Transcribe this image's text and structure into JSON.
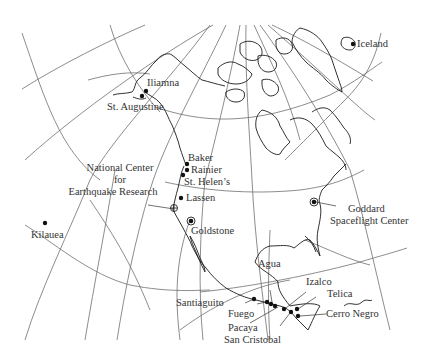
{
  "map": {
    "title": "North America volcano and observation site map",
    "colors": {
      "background": "#ffffff",
      "coastline": "#1a1a1a",
      "graticule": "#6e6e6e",
      "marker": "#111111",
      "label": "#333333"
    },
    "volcanoes": [
      {
        "id": "iliamna",
        "label": "Iliamna",
        "x": 146,
        "y": 91
      },
      {
        "id": "st-augustine",
        "label": "St. Augustine",
        "x": 142,
        "y": 96
      },
      {
        "id": "baker",
        "label": "Baker",
        "x": 187,
        "y": 164
      },
      {
        "id": "rainier",
        "label": "Rainier",
        "x": 187,
        "y": 170
      },
      {
        "id": "st-helens",
        "label": "St. Helen’s",
        "x": 183,
        "y": 175
      },
      {
        "id": "lassen",
        "label": "Lassen",
        "x": 181,
        "y": 198
      },
      {
        "id": "kilauea",
        "label": "Kilauea",
        "x": 45,
        "y": 223
      },
      {
        "id": "agua",
        "label": "Agua",
        "x": 273,
        "y": 303
      },
      {
        "id": "santiaguito",
        "label": "Santiaguito",
        "x": 254,
        "y": 299
      },
      {
        "id": "fuego",
        "label": "Fuego",
        "x": 268,
        "y": 302
      },
      {
        "id": "pacaya",
        "label": "Pacaya",
        "x": 276,
        "y": 306
      },
      {
        "id": "izalco",
        "label": "Izalco",
        "x": 283,
        "y": 308
      },
      {
        "id": "san-cristobal",
        "label": "San Cristobal",
        "x": 290,
        "y": 311
      },
      {
        "id": "telica",
        "label": "Telica",
        "x": 297,
        "y": 310
      },
      {
        "id": "cerro-negro",
        "label": "Cerro Negro",
        "x": 298,
        "y": 316
      },
      {
        "id": "iceland",
        "label": "Iceland",
        "x": 353,
        "y": 44
      }
    ],
    "stations": [
      {
        "id": "ncer",
        "label_line1": "National Center",
        "label_line2": "for",
        "label_line3": "Earthquake Research",
        "x": 174,
        "y": 207
      },
      {
        "id": "goldstone",
        "label": "Goldstone",
        "x": 191,
        "y": 221
      },
      {
        "id": "goddard",
        "label_line1": "Goddard",
        "label_line2": "Spaceflight Center",
        "x": 314,
        "y": 202
      }
    ],
    "labels": {
      "iliamna": "Iliamna",
      "st_augustine": "St. Augustine",
      "baker": "Baker",
      "rainier": "Rainier",
      "st_helens": "St. Helen’s",
      "lassen": "Lassen",
      "kilauea": "Kilauea",
      "iceland": "Iceland",
      "ncer_1": "National Center",
      "ncer_2": "for",
      "ncer_3": "Earthquake Research",
      "goldstone": "Goldstone",
      "goddard_1": "Goddard",
      "goddard_2": "Spaceflight Center",
      "agua": "Agua",
      "izalco": "Izalco",
      "telica": "Telica",
      "santiaguito": "Santiaguito",
      "fuego": "Fuego",
      "cerro_negro": "Cerro Negro",
      "pacaya": "Pacaya",
      "san_cristobal": "San Cristobal"
    }
  }
}
